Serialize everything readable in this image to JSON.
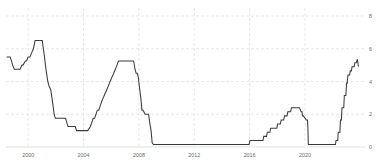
{
  "chart_data": {
    "type": "line",
    "title": "",
    "subtitle": "",
    "xlabel": "",
    "ylabel": "",
    "xlim": [
      1998.4,
      2023.9
    ],
    "ylim": [
      0,
      8
    ],
    "grid": true,
    "legend": null,
    "legend_position": "none",
    "line_color": "#3a3a3a",
    "grid_color": "#d8d8d8",
    "background_color": "#ffffff",
    "y_ticks": [
      0,
      2,
      4,
      6,
      8
    ],
    "y_tick_labels": [
      "0",
      "2",
      "4",
      "6",
      "8"
    ],
    "x_ticks": [
      2000,
      2004,
      2008,
      2012,
      2016,
      2020
    ],
    "x_tick_labels": [
      "2000",
      "2004",
      "2008",
      "2012",
      "2016",
      "2020"
    ],
    "series": [
      {
        "name": "Federal Funds Rate",
        "x": [
          1998.45,
          1998.7,
          1998.8,
          1998.88,
          1999.0,
          1999.1,
          1999.2,
          1999.42,
          1999.55,
          1999.63,
          1999.8,
          1999.88,
          2000.0,
          2000.13,
          2000.25,
          2000.38,
          2000.5,
          2000.75,
          2000.95,
          2001.02,
          2001.1,
          2001.18,
          2001.25,
          2001.33,
          2001.42,
          2001.5,
          2001.63,
          2001.72,
          2001.8,
          2001.88,
          2001.96,
          2002.1,
          2002.4,
          2002.7,
          2002.88,
          2003.0,
          2003.2,
          2003.4,
          2003.5,
          2003.7,
          2004.0,
          2004.3,
          2004.5,
          2004.6,
          2004.7,
          2004.8,
          2004.9,
          2005.0,
          2005.1,
          2005.2,
          2005.3,
          2005.42,
          2005.55,
          2005.68,
          2005.8,
          2005.92,
          2006.05,
          2006.18,
          2006.3,
          2006.42,
          2006.52,
          2006.7,
          2007.0,
          2007.4,
          2007.62,
          2007.72,
          2007.8,
          2007.88,
          2007.96,
          2008.06,
          2008.14,
          2008.22,
          2008.3,
          2008.45,
          2008.7,
          2008.78,
          2008.88,
          2008.96,
          2009.05,
          2009.5,
          2010.0,
          2011.0,
          2012.0,
          2013.0,
          2014.0,
          2015.0,
          2015.7,
          2015.96,
          2016.02,
          2016.5,
          2016.96,
          2017.02,
          2017.22,
          2017.28,
          2017.46,
          2017.52,
          2017.96,
          2018.02,
          2018.22,
          2018.28,
          2018.46,
          2018.52,
          2018.7,
          2018.76,
          2018.96,
          2019.02,
          2019.55,
          2019.6,
          2019.72,
          2019.78,
          2019.82,
          2019.88,
          2020.1,
          2020.18,
          2020.21,
          2020.24,
          2020.5,
          2021.0,
          2021.5,
          2022.0,
          2022.2,
          2022.24,
          2022.36,
          2022.4,
          2022.52,
          2022.56,
          2022.63,
          2022.67,
          2022.8,
          2022.84,
          2022.95,
          2023.0,
          2023.05,
          2023.1,
          2023.22,
          2023.27,
          2023.35,
          2023.4,
          2023.55,
          2023.6,
          2023.7,
          2023.78,
          2023.86
        ],
        "values": [
          5.5,
          5.5,
          5.25,
          5.0,
          4.75,
          4.75,
          4.75,
          4.75,
          5.0,
          5.0,
          5.25,
          5.25,
          5.5,
          5.5,
          5.75,
          6.0,
          6.5,
          6.5,
          6.5,
          6.5,
          6.0,
          5.5,
          5.0,
          4.5,
          4.0,
          3.75,
          3.5,
          3.0,
          2.5,
          2.0,
          1.75,
          1.75,
          1.75,
          1.75,
          1.25,
          1.25,
          1.25,
          1.25,
          1.0,
          1.0,
          1.0,
          1.0,
          1.25,
          1.5,
          1.75,
          1.75,
          2.0,
          2.25,
          2.25,
          2.5,
          2.75,
          3.0,
          3.25,
          3.5,
          3.75,
          4.0,
          4.25,
          4.5,
          4.75,
          5.0,
          5.25,
          5.25,
          5.25,
          5.25,
          5.25,
          4.75,
          4.5,
          4.5,
          4.25,
          3.5,
          3.0,
          2.25,
          2.25,
          2.0,
          2.0,
          1.5,
          1.0,
          0.25,
          0.15,
          0.15,
          0.15,
          0.15,
          0.15,
          0.15,
          0.15,
          0.15,
          0.15,
          0.15,
          0.4,
          0.4,
          0.4,
          0.65,
          0.65,
          0.9,
          0.9,
          1.15,
          1.15,
          1.4,
          1.4,
          1.65,
          1.65,
          1.9,
          1.9,
          2.15,
          2.15,
          2.4,
          2.4,
          2.4,
          2.15,
          2.15,
          1.9,
          1.9,
          1.65,
          1.65,
          1.1,
          0.15,
          0.15,
          0.15,
          0.15,
          0.15,
          0.15,
          0.4,
          0.4,
          0.9,
          0.9,
          1.65,
          1.65,
          2.4,
          2.4,
          3.15,
          3.15,
          3.9,
          3.9,
          4.4,
          4.4,
          4.65,
          4.65,
          4.9,
          4.9,
          5.15,
          5.15,
          5.35,
          4.9
        ]
      }
    ],
    "annotations": []
  }
}
